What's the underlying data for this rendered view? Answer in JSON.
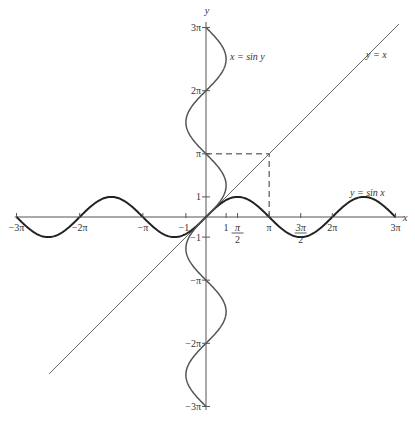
{
  "chart_data": {
    "type": "line",
    "title": "",
    "xlabel": "x",
    "ylabel": "y",
    "xlim": [
      -9.42,
      9.9
    ],
    "ylim": [
      -9.42,
      9.9
    ],
    "x_ticks": [
      {
        "value": -9.4248,
        "label": "−3π"
      },
      {
        "value": -6.2832,
        "label": "−2π"
      },
      {
        "value": -3.1416,
        "label": "−π"
      },
      {
        "value": -1,
        "label": "−1"
      },
      {
        "value": 1,
        "label": "1"
      },
      {
        "value": 1.5708,
        "label": "π/2"
      },
      {
        "value": 3.1416,
        "label": "π"
      },
      {
        "value": 4.7124,
        "label": "3π/2"
      },
      {
        "value": 6.2832,
        "label": "2π"
      },
      {
        "value": 9.4248,
        "label": "3π"
      }
    ],
    "y_ticks": [
      {
        "value": 9.4248,
        "label": "3π"
      },
      {
        "value": 6.2832,
        "label": "2π"
      },
      {
        "value": 3.1416,
        "label": "π"
      },
      {
        "value": 1,
        "label": "1"
      },
      {
        "value": -1,
        "label": "−1"
      },
      {
        "value": -3.1416,
        "label": "−π"
      },
      {
        "value": -6.2832,
        "label": "−2π"
      },
      {
        "value": -9.4248,
        "label": "−3π"
      }
    ],
    "series": [
      {
        "name": "y = sin x",
        "function": "sin(x)",
        "domain": [
          -9.4248,
          9.4248
        ],
        "style": "thick-dark"
      },
      {
        "name": "x = sin y",
        "function": "x = sin(y)",
        "domain_y": [
          -9.4248,
          9.4248
        ],
        "style": "medium-gray"
      },
      {
        "name": "y = x",
        "function": "x",
        "domain": [
          -7.8,
          9.6
        ],
        "style": "thin-gray"
      }
    ],
    "annotations": [
      {
        "type": "dashed-box",
        "corner": [
          3.1416,
          3.1416
        ],
        "description": "dashed lines from (π,0) up to (π,π) and across to (0,π)"
      }
    ],
    "labels": {
      "sinx": "y = sin x",
      "siny": "x = sin y",
      "yx": "y = x",
      "xaxis": "x",
      "yaxis": "y"
    },
    "grid": false,
    "legend": "none"
  }
}
